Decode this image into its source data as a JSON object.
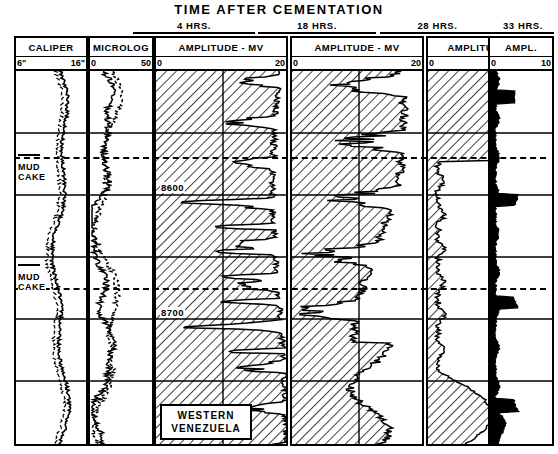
{
  "title": "TIME AFTER CEMENTATION",
  "time_labels": [
    {
      "text": "4 HRS.",
      "left": 133,
      "width": 122
    },
    {
      "text": "18 HRS.",
      "left": 258,
      "width": 118
    },
    {
      "text": "28 HRS.",
      "left": 380,
      "width": 115
    },
    {
      "text": "33 HRS.",
      "left": 492,
      "width": 62
    }
  ],
  "tracks": [
    {
      "id": "caliper",
      "header": "CALIPER",
      "lo": "6\"",
      "hi": "16\"",
      "left": 14,
      "width": 74
    },
    {
      "id": "microlog",
      "header": "MICROLOG",
      "lo": "0",
      "hi": "50",
      "left": 90,
      "width": 64
    },
    {
      "id": "amp4",
      "header": "AMPLITUDE - MV",
      "lo": "0",
      "hi": "20",
      "left": 154,
      "width": 134
    },
    {
      "id": "amp18",
      "header": "AMPLITUDE - MV",
      "lo": "0",
      "hi": "20",
      "left": 291,
      "width": 133
    },
    {
      "id": "amp28",
      "header": "AMPLITUDE - MV",
      "lo": "0",
      "hi": "20",
      "left": 427,
      "width": 128
    },
    {
      "id": "amp33",
      "header": "AMPL.",
      "lo": "0",
      "hi": "10",
      "left": 558,
      "width": 66
    }
  ],
  "annotations": {
    "depth_labels": [
      {
        "text": "8600",
        "top": 182
      },
      {
        "text": "8700",
        "top": 307
      }
    ],
    "mud_cake_labels": [
      {
        "line1": "MUD",
        "line2": "CAKE",
        "top": 162
      },
      {
        "line1": "MUD",
        "line2": "CAKE",
        "top": 272
      }
    ],
    "location_box": {
      "line1": "WESTERN",
      "line2": "VENEZUELA"
    }
  },
  "chart_data": {
    "type": "line",
    "title": "TIME AFTER CEMENTATION",
    "ylabel": "Depth (ft)",
    "ylim": [
      8800,
      8500
    ],
    "depth_ticks": [
      8600,
      8700
    ],
    "panels": [
      {
        "name": "CALIPER",
        "xlabel": "CALIPER",
        "units": "inches",
        "xlim": [
          6,
          16
        ],
        "series": [
          {
            "name": "caliper",
            "style": "solid-wiggly",
            "values": [
              13.2,
              13.4,
              13.1,
              13.5,
              13.2,
              13.6,
              13.3,
              13.0,
              13.4,
              13.1,
              13.5,
              13.3,
              13.6,
              13.2,
              12.9,
              13.3,
              13.0,
              12.8,
              13.2,
              12.9,
              12.6,
              12.4,
              12.7,
              12.3,
              12.6,
              12.2,
              12.5,
              12.1,
              12.4,
              12.2,
              12.6,
              12.3,
              12.7,
              12.4,
              12.8,
              12.5,
              12.9,
              12.6,
              13.0,
              12.7,
              13.1,
              12.8,
              12.5,
              12.9,
              12.6,
              13.0,
              12.7,
              13.1,
              12.8,
              12.5
            ]
          }
        ]
      },
      {
        "name": "MICROLOG",
        "xlabel": "MICROLOG",
        "units": "mv",
        "xlim": [
          0,
          50
        ],
        "series": [
          {
            "name": "micro-normal",
            "style": "solid",
            "values": [
              7,
              12,
              9,
              16,
              11,
              19,
              13,
              22,
              15,
              24,
              17,
              21,
              14,
              18,
              12,
              16,
              10,
              14,
              9,
              12,
              8,
              11,
              7,
              10,
              8,
              9,
              7,
              8,
              7,
              9,
              8,
              10,
              9,
              11,
              10,
              12,
              11,
              13,
              12,
              14,
              13,
              16,
              14,
              18,
              15,
              20,
              17,
              22,
              19,
              24
            ]
          },
          {
            "name": "micro-inverse",
            "style": "dashed",
            "values": [
              9,
              14,
              11,
              18,
              13,
              21,
              15,
              24,
              17,
              26,
              19,
              23,
              16,
              20,
              14,
              18,
              12,
              16,
              11,
              14,
              10,
              13,
              9,
              12,
              10,
              11,
              9,
              10,
              9,
              11,
              10,
              12,
              11,
              13,
              12,
              14,
              13,
              15,
              14,
              16,
              15,
              18,
              16,
              20,
              17,
              22,
              19,
              24,
              21,
              26
            ]
          }
        ]
      },
      {
        "name": "AMPLITUDE - MV (4 HRS.)",
        "xlabel": "AMPLITUDE - MV",
        "units": "mv",
        "xlim": [
          0,
          20
        ],
        "series": [
          {
            "name": "amplitude-4hrs",
            "style": "solid-hatch-left",
            "values": [
              19.0,
              18.6,
              19.2,
              18.4,
              19.3,
              18.0,
              17.2,
              18.6,
              17.6,
              18.8,
              17.4,
              18.2,
              16.4,
              17.8,
              18.4,
              17.0,
              18.6,
              16.6,
              17.8,
              18.8,
              17.2,
              12.0,
              17.6,
              10.5,
              16.8,
              13.0,
              17.4,
              11.0,
              16.2,
              13.6,
              17.0,
              12.0,
              16.6,
              14.0,
              17.2,
              12.6,
              16.8,
              15.0,
              17.4,
              13.4,
              17.0,
              15.6,
              17.8,
              14.0,
              17.4,
              16.0,
              18.0,
              15.0,
              17.6,
              16.6
            ]
          }
        ]
      },
      {
        "name": "AMPLITUDE - MV (18 HRS.)",
        "xlabel": "AMPLITUDE - MV",
        "units": "mv",
        "xlim": [
          0,
          20
        ],
        "series": [
          {
            "name": "amplitude-18hrs",
            "style": "solid-hatch-left",
            "values": [
              18.0,
              15.6,
              17.4,
              13.0,
              16.6,
              11.0,
              15.4,
              12.6,
              16.0,
              13.4,
              15.2,
              12.0,
              14.6,
              10.4,
              13.8,
              12.4,
              15.0,
              9.0,
              13.2,
              7.4,
              12.0,
              5.6,
              10.8,
              8.2,
              12.4,
              6.0,
              11.0,
              4.4,
              9.6,
              7.0,
              11.4,
              5.0,
              10.0,
              3.2,
              8.6,
              6.4,
              11.2,
              8.0,
              12.6,
              9.4,
              13.2,
              7.6,
              12.0,
              10.0,
              13.6,
              8.4,
              12.4,
              10.6,
              13.0,
              11.4
            ]
          }
        ]
      },
      {
        "name": "AMPLITUDE - MV (28 HRS.)",
        "xlabel": "AMPLITUDE - MV",
        "units": "mv",
        "xlim": [
          0,
          20
        ],
        "series": [
          {
            "name": "amplitude-28hrs",
            "style": "solid-hatch-left",
            "values": [
              8.0,
              10.6,
              9.0,
              12.4,
              10.0,
              14.0,
              11.0,
              12.6,
              9.4,
              7.0,
              4.0,
              2.4,
              3.0,
              1.8,
              2.6,
              1.4,
              2.2,
              1.2,
              2.0,
              1.0,
              1.8,
              1.1,
              2.4,
              1.2,
              1.9,
              1.0,
              1.6,
              0.9,
              1.5,
              1.0,
              1.8,
              1.2,
              2.6,
              1.4,
              2.0,
              1.1,
              1.7,
              1.0,
              1.6,
              1.2,
              2.8,
              4.0,
              3.2,
              6.0,
              9.0,
              13.0,
              10.0,
              7.0,
              4.4,
              3.0
            ]
          }
        ]
      },
      {
        "name": "AMPL. (33 HRS.)",
        "xlabel": "AMPL.",
        "units": "mv",
        "xlim": [
          0,
          10
        ],
        "series": [
          {
            "name": "amplitude-33hrs",
            "style": "solid",
            "values": [
              1.4,
              2.6,
              1.6,
              3.4,
              1.8,
              2.2,
              1.4,
              1.8,
              1.2,
              1.6,
              1.1,
              1.5,
              1.0,
              1.4,
              1.2,
              2.0,
              1.3,
              3.6,
              1.6,
              2.4,
              1.2,
              1.8,
              1.0,
              1.5,
              1.1,
              1.7,
              1.0,
              1.4,
              1.0,
              1.6,
              1.1,
              2.2,
              1.4,
              3.0,
              1.6,
              2.0,
              1.2,
              1.6,
              1.0,
              1.5,
              1.1,
              2.6,
              1.8,
              4.2,
              2.0,
              2.8,
              1.5,
              2.0,
              1.3,
              1.8
            ]
          }
        ]
      }
    ]
  }
}
